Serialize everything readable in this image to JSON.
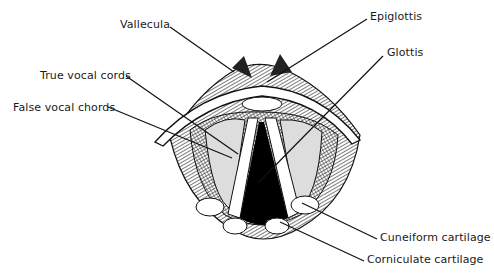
{
  "diagram": {
    "labels": [
      {
        "id": "vallecula",
        "text": "Vallecula",
        "x": 120,
        "y": 18
      },
      {
        "id": "epiglottis",
        "text": "Epiglottis",
        "x": 370,
        "y": 10
      },
      {
        "id": "glottis",
        "text": "Glottis",
        "x": 387,
        "y": 46
      },
      {
        "id": "true-vocal-cords",
        "text": "True vocal cords",
        "x": 40,
        "y": 69
      },
      {
        "id": "false-vocal-chords",
        "text": "False vocal chords",
        "x": 13,
        "y": 101
      },
      {
        "id": "cuneiform-cartilage",
        "text": "Cuneiform cartilage",
        "x": 380,
        "y": 231
      },
      {
        "id": "corniculate-cartilage",
        "text": "Corniculate cartilage",
        "x": 367,
        "y": 253
      }
    ]
  }
}
